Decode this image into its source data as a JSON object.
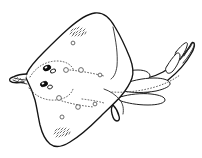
{
  "figure": {
    "view": "dorsal",
    "caption": "",
    "caption_visible": false,
    "medium": "ink line drawing",
    "background_color": "#ffffff",
    "outline_color": "#141414",
    "detail_color": "#2b2b2b",
    "accent_color": "#0d0d0d",
    "canvas": {
      "width": 202,
      "height": 158
    }
  },
  "anatomy": {
    "disc": {
      "label": "pectoral disc",
      "description": "rhomboid disc with concave posterior margins and pointed snout at left",
      "path": "M 27 73 C 30 66 36 60 44 52 C 52 44 60 36 68 29 C 77 21 86 14 95 13 C 103 12 110 18 115 27 C 121 37 126 48 130 58 C 133 66 134 72 132 78 C 130 84 126 90 121 96 C 115 103 107 110 99 118 C 90 127 80 136 70 142 C 62 147 55 148 50 144 C 45 140 42 133 40 125 C 38 116 37 108 35 100 C 33 93 30 86 27 80 C 25 77 25 75 27 73 Z"
    },
    "snout": {
      "label": "snout tip",
      "path": "M 27 73 C 22 74 17 75 13 77 C 10 78 9 79 10 81 C 12 83 18 83 24 82 C 28 81 29 78 27 73 Z"
    },
    "tail": {
      "label": "tail",
      "path": "M 128 79 C 140 80 152 78 163 72 C 172 67 179 60 185 53 C 188 49 190 46 191 44 C 192 42 193 42 194 43 C 195 45 194 49 191 54 C 186 63 178 72 168 80 C 157 89 144 95 132 97 C 124 98 118 96 115 93 C 112 90 114 86 119 83 C 122 81 125 80 128 79 Z"
    },
    "tail_tip": {
      "label": "tail tip hook",
      "path": "M 185 53 C 188 49 191 45 193 43 C 195 41 196 42 195 45 C 193 50 189 57 184 63"
    },
    "dorsal_fin_first": {
      "label": "first dorsal fin",
      "path": "M 167 66 C 170 61 173 57 176 54 C 178 52 180 53 180 56 C 180 60 177 66 173 71 C 170 74 167 74 166 71 C 165 69 166 67 167 66 Z"
    },
    "dorsal_fin_second": {
      "label": "second dorsal fin",
      "path": "M 176 52 C 179 48 182 45 185 43 C 187 42 188 43 187 46 C 186 50 183 55 180 59 C 178 61 176 61 175 59 C 174 57 175 54 176 52 Z"
    },
    "pelvic_fin_upper": {
      "label": "upper pelvic fin lobe",
      "path": "M 123 83 C 132 80 143 78 153 78 C 162 78 168 80 169 83 C 170 86 165 89 156 91 C 146 93 134 93 126 91 C 121 89 120 85 123 83 Z"
    },
    "pelvic_fin_lower": {
      "label": "lower pelvic fin lobe",
      "path": "M 122 96 C 131 94 142 93 151 94 C 159 95 164 97 164 100 C 164 103 158 105 149 105 C 139 105 129 103 123 101 C 119 99 119 97 122 96 Z"
    },
    "pelvic_fin_anterior": {
      "label": "anterior pelvic lobe",
      "path": "M 112 76 C 120 73 130 71 138 71 C 145 71 149 73 149 76 C 149 79 144 81 136 82 C 127 83 117 82 112 80 C 109 79 109 77 112 76 Z"
    },
    "clasper": {
      "label": "clasper",
      "path": "M 116 106 C 118 109 120 113 121 117 C 122 120 121 122 119 122 C 117 122 115 119 114 115 C 113 111 113 108 116 106 Z"
    },
    "pectoral_rear_margin": {
      "label": "posterior pectoral margin",
      "path": "M 104 88 C 110 90 116 94 120 99 C 123 103 124 108 123 113"
    },
    "wing_crease_upper": {
      "label": "upper wing crease",
      "path": "M 112 28 C 115 41 117 54 116 66 C 115 73 113 77 110 79"
    },
    "eyes": [
      {
        "label": "left eye",
        "cx": 47,
        "cy": 68,
        "rx": 4.0,
        "ry": 2.6,
        "rotation": -22
      },
      {
        "label": "right eye",
        "cx": 44,
        "cy": 84,
        "rx": 3.8,
        "ry": 2.5,
        "rotation": -20
      }
    ],
    "spiracles": [
      {
        "label": "left spiracle",
        "cx": 53,
        "cy": 71,
        "rx": 2.6,
        "ry": 1.8,
        "rotation": -22
      },
      {
        "label": "right spiracle",
        "cx": 50,
        "cy": 87,
        "rx": 2.5,
        "ry": 1.8,
        "rotation": -20
      }
    ],
    "orbital_thorn_arcs": [
      {
        "label": "upper orbital thorn arc",
        "path": "M 30 76 C 36 66 46 60 57 60 C 66 60 72 64 74 70"
      },
      {
        "label": "lower orbital thorn arc",
        "path": "M 29 88 C 35 96 45 101 56 100 C 65 99 71 95 73 89"
      }
    ],
    "nuchal_thorn_rows": [
      {
        "label": "upper median thorn row",
        "path": "M 76 70 C 86 71 96 73 106 76"
      },
      {
        "label": "lower median thorn row",
        "path": "M 72 96 C 82 98 93 100 103 102"
      },
      {
        "label": "mid median thorn row",
        "path": "M 62 101 C 72 104 83 106 94 107"
      },
      {
        "label": "tail thorn row",
        "path": "M 112 92 C 126 93 141 91 155 87 C 165 84 173 80 180 75"
      }
    ],
    "thorn_bases": [
      {
        "label": "thorn base",
        "cx": 66,
        "cy": 70,
        "r": 2.4
      },
      {
        "label": "thorn base",
        "cx": 81,
        "cy": 70,
        "r": 2.4
      },
      {
        "label": "thorn base",
        "cx": 100,
        "cy": 75,
        "r": 1.9
      },
      {
        "label": "thorn base",
        "cx": 59,
        "cy": 98,
        "r": 2.4
      },
      {
        "label": "thorn base",
        "cx": 78,
        "cy": 107,
        "r": 2.3
      },
      {
        "label": "thorn base",
        "cx": 95,
        "cy": 104,
        "r": 1.9
      },
      {
        "label": "thorn base",
        "cx": 62,
        "cy": 117,
        "r": 2.0
      },
      {
        "label": "thorn base",
        "cx": 73,
        "cy": 43,
        "r": 1.9
      }
    ],
    "thorn_patches": [
      {
        "label": "anterior dorsal thorn patch",
        "cx": 78,
        "cy": 32,
        "count": 14
      },
      {
        "label": "posterior dorsal thorn patch",
        "cx": 62,
        "cy": 133,
        "count": 14
      }
    ]
  },
  "labels": {
    "figure_caption": "",
    "scale_bar": ""
  }
}
